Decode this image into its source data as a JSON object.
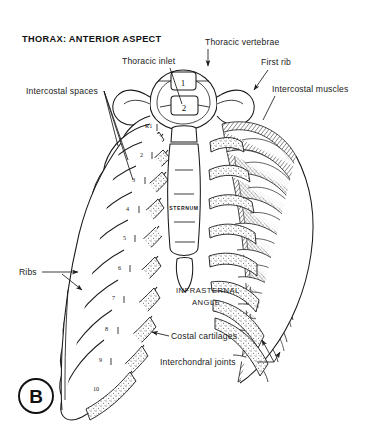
{
  "figure": {
    "title": "THORAX: ANTERIOR ASPECT",
    "panel_label": "B",
    "background_color": "#ffffff",
    "ink_color": "#1a1a1a"
  },
  "labels": {
    "thoracic_inlet": "Thoracic inlet",
    "thoracic_vertebrae": "Thoracic vertebrae",
    "first_rib": "First rib",
    "intercostal_spaces": "Intercostal spaces",
    "intercostal_muscles": "Intercostal muscles",
    "ribs": "Ribs",
    "sternum": "STERNUM",
    "infrasternal_angle_line1": "INFRASTERNAL",
    "infrasternal_angle_line2": "ANGLE",
    "costal_cartilages": "Costal cartilages",
    "interchondral_joints": "Interchondral joints"
  },
  "vertebrae": [
    {
      "id": "T1",
      "number": "1"
    },
    {
      "id": "T2",
      "number": "2"
    }
  ],
  "rib_numbers": [
    {
      "id": "rib-1",
      "text": "R1"
    },
    {
      "id": "rib-2",
      "text": "2"
    },
    {
      "id": "rib-3",
      "text": "3"
    },
    {
      "id": "rib-4",
      "text": "4"
    },
    {
      "id": "rib-5",
      "text": "5"
    },
    {
      "id": "rib-6",
      "text": "6"
    },
    {
      "id": "rib-7",
      "text": "7"
    },
    {
      "id": "rib-8",
      "text": "8"
    },
    {
      "id": "rib-9",
      "text": "9"
    },
    {
      "id": "rib-10",
      "text": "10"
    }
  ]
}
